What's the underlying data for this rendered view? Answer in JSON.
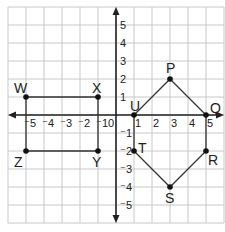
{
  "diagram": {
    "type": "coordinate-plane",
    "grid": {
      "min": -6,
      "max": 6,
      "cell_px": 18,
      "origin_px": [
        116,
        115
      ],
      "grid_color": "#c8c8c8",
      "axis_color": "#222222"
    },
    "x_tick_labels": [
      "-5",
      "-4",
      "-3",
      "-2",
      "-1",
      "0",
      "1",
      "2",
      "3",
      "4",
      "5"
    ],
    "y_tick_labels": [
      "5",
      "4",
      "3",
      "2",
      "1",
      "-1",
      "-2",
      "-3",
      "-4",
      "-5"
    ],
    "rectangle": {
      "name": "WXYZ",
      "points": [
        {
          "label": "W",
          "x": -5,
          "y": 1
        },
        {
          "label": "X",
          "x": -1,
          "y": 1
        },
        {
          "label": "Y",
          "x": -1,
          "y": -2
        },
        {
          "label": "Z",
          "x": -5,
          "y": -2
        }
      ]
    },
    "hexagon": {
      "name": "PQRSTU",
      "points": [
        {
          "label": "P",
          "x": 3,
          "y": 2
        },
        {
          "label": "Q",
          "x": 5,
          "y": 0
        },
        {
          "label": "R",
          "x": 5,
          "y": -2
        },
        {
          "label": "S",
          "x": 3,
          "y": -4
        },
        {
          "label": "T",
          "x": 1,
          "y": -2
        },
        {
          "label": "U",
          "x": 1,
          "y": 0
        }
      ]
    }
  }
}
